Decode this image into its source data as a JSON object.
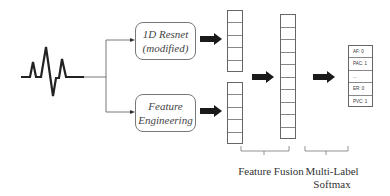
{
  "diagram": {
    "input": {
      "icon": "ecg-waveform-icon"
    },
    "branches": [
      {
        "label_line1": "1D Resnet",
        "label_line2": "(modified)"
      },
      {
        "label_line1": "Feature",
        "label_line2": "Engineering"
      }
    ],
    "feature_vectors": {
      "top_cells": 5,
      "bottom_cells": 5,
      "fused_cells": 10
    },
    "output": {
      "rows": [
        "AF: 0",
        "PAC: 1",
        "...",
        "ER: 0",
        "PVC: 1"
      ]
    },
    "stage_labels": {
      "fusion": "Feature Fusion",
      "softmax_line1": "Multi-Label",
      "softmax_line2": "Softmax"
    },
    "colors": {
      "line": "#555555",
      "arrow": "#1a1a1a",
      "box_border": "#777777"
    }
  }
}
